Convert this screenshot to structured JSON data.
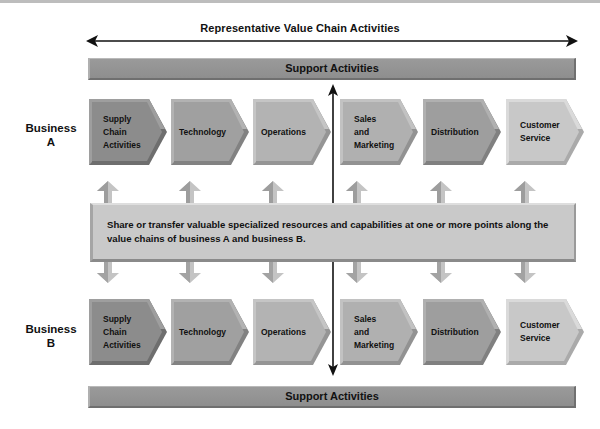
{
  "title": "Representative Value Chain Activities",
  "support_top": "Support Activities",
  "support_bottom": "Support Activities",
  "business_a": {
    "line1": "Business",
    "line2": "A"
  },
  "business_b": {
    "line1": "Business",
    "line2": "B"
  },
  "activities": [
    {
      "label": "Supply Chain Activities",
      "lines": [
        "Supply",
        "Chain",
        "Activities"
      ],
      "color": "#8c8c8c"
    },
    {
      "label": "Technology",
      "lines": [
        "Technology"
      ],
      "color": "#a0a0a0"
    },
    {
      "label": "Operations",
      "lines": [
        "Operations"
      ],
      "color": "#b3b3b3"
    },
    {
      "label": "Sales and Marketing",
      "lines": [
        "Sales",
        "and",
        "Marketing"
      ],
      "color": "#b0b0b0"
    },
    {
      "label": "Distribution",
      "lines": [
        "Distribution"
      ],
      "color": "#9e9e9e"
    },
    {
      "label": "Customer Service",
      "lines": [
        "Customer",
        "Service"
      ],
      "color": "#c8c8c8"
    }
  ],
  "share_text": "Share or transfer valuable specialized resources and capabilities at one or more points along the value chains of business A and business B.",
  "colors": {
    "support_bar": "#949494",
    "share_box": "#c9c9c9",
    "arrow": "#b5b5b5",
    "line": "#111111"
  }
}
